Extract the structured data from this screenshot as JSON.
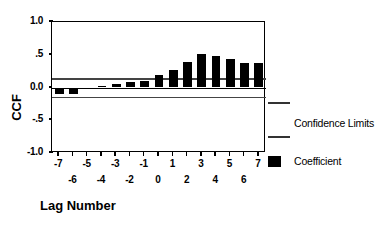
{
  "chart_data": {
    "type": "bar",
    "title": "",
    "subtitle": "",
    "xlabel": "Lag Number",
    "ylabel": "CCF",
    "ylim": [
      -1.0,
      1.0
    ],
    "xlim": [
      -7,
      7
    ],
    "grid": false,
    "legend_position": "right",
    "categories": [
      "-7",
      "-6",
      "-5",
      "-4",
      "-3",
      "-2",
      "-1",
      "0",
      "1",
      "2",
      "3",
      "4",
      "5",
      "6",
      "7"
    ],
    "values": [
      -0.1,
      -0.1,
      -0.02,
      0.03,
      0.06,
      0.08,
      0.1,
      0.19,
      0.26,
      0.39,
      0.51,
      0.48,
      0.43,
      0.38,
      0.38
    ],
    "series": [
      {
        "name": "Coefficient",
        "values": [
          -0.1,
          -0.1,
          -0.02,
          0.03,
          0.06,
          0.08,
          0.1,
          0.19,
          0.26,
          0.39,
          0.51,
          0.48,
          0.43,
          0.38,
          0.38
        ]
      }
    ],
    "confidence_limits": {
      "upper": 0.14,
      "lower": -0.14,
      "label": "Confidence Limits"
    },
    "y_ticks": [
      "1.0",
      ".5",
      "0.0",
      "-.5",
      "-1.0"
    ],
    "y_tick_values": [
      1.0,
      0.5,
      0.0,
      -0.5,
      -1.0
    ],
    "x_ticks_top_row": [
      "-7",
      "-5",
      "-3",
      "-1",
      "1",
      "3",
      "5",
      "7"
    ],
    "x_ticks_bottom_row": [
      "-6",
      "-4",
      "-2",
      "0",
      "2",
      "4",
      "6"
    ],
    "colors": {
      "bar": "#000000",
      "confidence": "#444444",
      "axis": "#000000",
      "background": "#ffffff"
    }
  },
  "axes": {
    "y_title": "CCF",
    "x_title": "Lag Number"
  },
  "legend": {
    "items": [
      {
        "label": "Confidence Limits",
        "marker": "line"
      },
      {
        "label": "Coefficient",
        "marker": "box"
      }
    ],
    "confidence_label": "Confidence Limits",
    "coefficient_label": "Coefficient"
  }
}
